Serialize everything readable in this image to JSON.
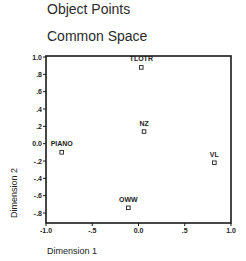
{
  "titles": {
    "main": "Object Points",
    "sub": "Common Space"
  },
  "chart_data": {
    "type": "scatter",
    "title": "Object Points",
    "subtitle": "Common Space",
    "xlabel": "Dimension 1",
    "ylabel": "Dimension 2",
    "xlim": [
      -1.0,
      1.0
    ],
    "ylim": [
      -1.0,
      1.0
    ],
    "x_ticks": [
      -1.0,
      -0.5,
      0.0,
      0.5,
      1.0
    ],
    "x_tick_labels": [
      "-1.0",
      "-.5",
      "0.0",
      ".5",
      "1.0"
    ],
    "y_ticks": [
      1.0,
      0.8,
      0.6,
      0.4,
      0.2,
      0.0,
      -0.2,
      -0.4,
      -0.6,
      -0.8
    ],
    "y_tick_labels": [
      "1.0",
      ".8",
      ".6",
      ".4",
      ".2",
      "0.0",
      "-.2",
      "-.4",
      "-.6",
      "-.8"
    ],
    "grid": false,
    "legend": null,
    "points": [
      {
        "label": "TLOTR",
        "x": 0.03,
        "y": 0.88
      },
      {
        "label": "NZ",
        "x": 0.06,
        "y": 0.14
      },
      {
        "label": "PIANO",
        "x": -0.83,
        "y": -0.1
      },
      {
        "label": "VL",
        "x": 0.82,
        "y": -0.22
      },
      {
        "label": "OWW",
        "x": -0.11,
        "y": -0.74
      }
    ]
  }
}
